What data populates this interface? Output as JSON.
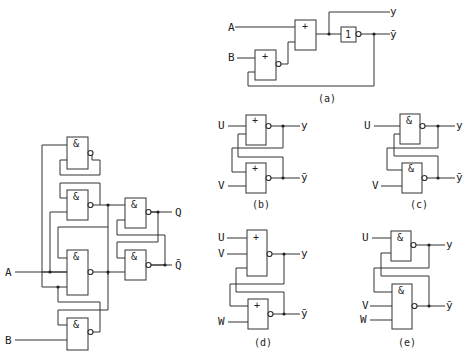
{
  "left_circuit": {
    "inputs": {
      "a": "A",
      "b": "B"
    },
    "outputs": {
      "q": "Q",
      "qbar": "Q̄"
    },
    "gate_symbol": "&"
  },
  "circuit_a": {
    "caption": "(a)",
    "inputs": {
      "a": "A",
      "b": "B"
    },
    "outputs": {
      "y": "y",
      "ybar": "ȳ"
    },
    "or_symbol": "+",
    "not_symbol": "1"
  },
  "circuit_b": {
    "caption": "(b)",
    "inputs": {
      "u": "U",
      "v": "V"
    },
    "outputs": {
      "y": "y",
      "ybar": "ȳ"
    },
    "gate_symbol": "+"
  },
  "circuit_c": {
    "caption": "(c)",
    "inputs": {
      "u": "U",
      "v": "V"
    },
    "outputs": {
      "y": "y",
      "ybar": "ȳ"
    },
    "gate_symbol": "&"
  },
  "circuit_d": {
    "caption": "(d)",
    "inputs": {
      "u": "U",
      "v": "V",
      "w": "W"
    },
    "outputs": {
      "y": "y",
      "ybar": "ȳ"
    },
    "gate_symbol": "+"
  },
  "circuit_e": {
    "caption": "(e)",
    "inputs": {
      "u": "U",
      "v": "V",
      "w": "W"
    },
    "outputs": {
      "y": "y",
      "ybar": "ȳ"
    },
    "gate_symbol": "&"
  }
}
